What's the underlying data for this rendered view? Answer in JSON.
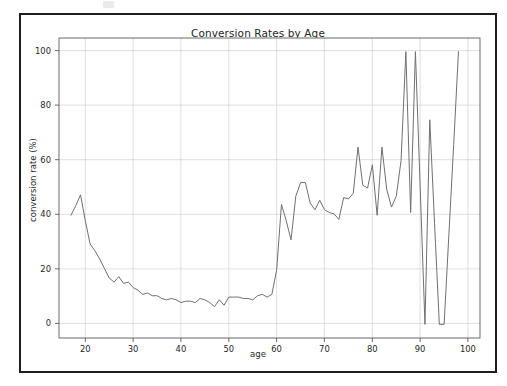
{
  "figure": {
    "title": "Conversion Rates by Age",
    "background": "#ffffff",
    "frame_color": "#1d1d1d"
  },
  "chart_data": {
    "type": "line",
    "title": "Conversion Rates by Age",
    "xlabel": "age",
    "ylabel": "conversion rate (%)",
    "xlim": [
      14.5,
      102.5
    ],
    "ylim": [
      -5,
      105
    ],
    "grid": true,
    "legend": null,
    "line_color": "#707070",
    "line_width": 1,
    "xticks": [
      20,
      30,
      40,
      50,
      60,
      70,
      80,
      90,
      100
    ],
    "yticks": [
      0,
      20,
      40,
      60,
      80,
      100
    ],
    "xtick_labels": [
      "20",
      "30",
      "40",
      "50",
      "60",
      "70",
      "80",
      "90",
      "100"
    ],
    "ytick_labels": [
      "0",
      "20",
      "40",
      "60",
      "80",
      "100"
    ],
    "x": [
      17,
      18,
      19,
      20,
      21,
      22,
      23,
      24,
      25,
      26,
      27,
      28,
      29,
      30,
      31,
      32,
      33,
      34,
      35,
      36,
      37,
      38,
      39,
      40,
      41,
      42,
      43,
      44,
      45,
      46,
      47,
      48,
      49,
      50,
      51,
      52,
      53,
      54,
      55,
      56,
      57,
      58,
      59,
      60,
      61,
      62,
      63,
      64,
      65,
      66,
      67,
      68,
      69,
      70,
      71,
      72,
      73,
      74,
      75,
      76,
      77,
      78,
      79,
      80,
      81,
      82,
      83,
      84,
      85,
      86,
      87,
      88,
      89,
      90,
      91,
      92,
      93,
      94,
      95,
      96,
      97,
      98
    ],
    "y": [
      40.0,
      43.5,
      47.5,
      38.0,
      29.5,
      27.0,
      24.0,
      20.5,
      17.0,
      15.5,
      17.5,
      15.0,
      15.5,
      13.5,
      12.5,
      11.0,
      11.5,
      10.5,
      10.5,
      9.5,
      9.0,
      9.5,
      9.0,
      8.0,
      8.5,
      8.5,
      8.0,
      9.5,
      9.0,
      8.0,
      6.5,
      9.0,
      7.0,
      10.0,
      10.0,
      10.0,
      9.5,
      9.5,
      9.0,
      10.5,
      11.0,
      10.0,
      11.0,
      20.0,
      44.0,
      38.0,
      31.0,
      47.0,
      52.0,
      52.0,
      44.5,
      42.0,
      45.5,
      42.0,
      41.0,
      40.5,
      38.5,
      46.5,
      46.0,
      48.0,
      65.0,
      51.0,
      50.0,
      58.5,
      40.0,
      65.0,
      49.5,
      43.0,
      47.0,
      60.0,
      100.0,
      41.0,
      100.0,
      50.0,
      0.0,
      75.0,
      37.0,
      0.0,
      0.0,
      33.0,
      66.0,
      100.0
    ],
    "series_name": "conversion rate"
  }
}
